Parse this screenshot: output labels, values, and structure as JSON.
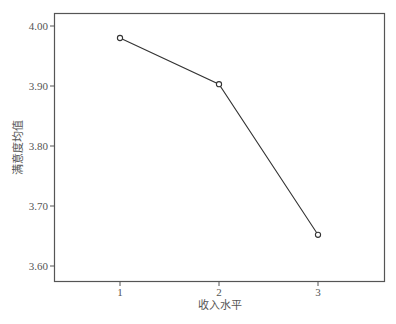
{
  "chart_data": {
    "type": "line",
    "title": "",
    "xlabel": "收入水平",
    "ylabel": "满意度均值",
    "categories": [
      "1",
      "2",
      "3"
    ],
    "x": [
      1,
      2,
      3
    ],
    "values": [
      3.98,
      3.903,
      3.652
    ],
    "series": [
      {
        "name": "满意度均值",
        "values": [
          3.98,
          3.903,
          3.652
        ],
        "marker": "circle-open"
      }
    ],
    "yticks": [
      "3.60",
      "3.70",
      "3.80",
      "3.90",
      "4.00"
    ],
    "ylim": [
      3.58,
      4.022
    ],
    "xlim": [
      0.66,
      3.64
    ],
    "grid": false,
    "legend": null
  },
  "style": {
    "line_color": "#333333",
    "frame_color": "#555555",
    "background": "#ffffff"
  }
}
